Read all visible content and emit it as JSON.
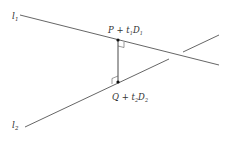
{
  "diagram": {
    "type": "geometry",
    "lines": [
      {
        "name": "l1",
        "label_main": "l",
        "label_sub": "1"
      },
      {
        "name": "l2",
        "label_main": "l",
        "label_sub": "2"
      }
    ],
    "points": [
      {
        "name": "P",
        "label": {
          "base": "P",
          "op": " + ",
          "param": "t",
          "param_sub": "1",
          "dir": "D",
          "dir_sub": "1"
        }
      },
      {
        "name": "Q",
        "label": {
          "base": "Q",
          "op": " + ",
          "param": "t",
          "param_sub": "2",
          "dir": "D",
          "dir_sub": "2"
        }
      }
    ],
    "segment": {
      "from": "P",
      "to": "Q",
      "perpendicular_to": [
        "l1",
        "l2"
      ]
    },
    "colors": {
      "line": "#555555",
      "point": "#111111",
      "text": "#333333",
      "background": "#ffffff"
    }
  }
}
